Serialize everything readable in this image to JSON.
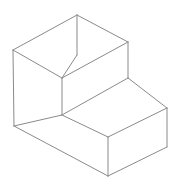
{
  "figure": {
    "type": "line-drawing",
    "background_color": "#ffffff",
    "line_color": "#8a8a8a",
    "line_width": 1,
    "canvas": {
      "width": 180,
      "height": 191
    },
    "vertices": {
      "top_apex": [
        77,
        15
      ],
      "top_left": [
        13,
        50
      ],
      "top_right": [
        128,
        42
      ],
      "top_inner": [
        62,
        78
      ],
      "mid_left_bottom": [
        14,
        126
      ],
      "mid_right": [
        128,
        78
      ],
      "step_front": [
        62,
        115
      ],
      "step_right_top": [
        167,
        108
      ],
      "step_far_right_top": [
        167,
        147
      ],
      "bottom_apex": [
        108,
        176
      ],
      "bottom_left_join": [
        62,
        152
      ],
      "bottom_mid": [
        108,
        137
      ]
    },
    "edges": [
      {
        "name": "top-face-left-back",
        "from": [
          13,
          50
        ],
        "to": [
          77,
          15
        ]
      },
      {
        "name": "top-face-right-back",
        "from": [
          77,
          15
        ],
        "to": [
          128,
          42
        ]
      },
      {
        "name": "top-face-right-front",
        "from": [
          128,
          42
        ],
        "to": [
          62,
          78
        ]
      },
      {
        "name": "top-face-left-front",
        "from": [
          62,
          78
        ],
        "to": [
          13,
          50
        ]
      },
      {
        "name": "vertical-center-spine",
        "from": [
          77,
          15
        ],
        "to": [
          77,
          55
        ]
      },
      {
        "name": "inner-edge-to-spine",
        "from": [
          77,
          55
        ],
        "to": [
          62,
          78
        ]
      },
      {
        "name": "left-vertical",
        "from": [
          13,
          50
        ],
        "to": [
          14,
          126
        ]
      },
      {
        "name": "right-vertical-upper",
        "from": [
          128,
          42
        ],
        "to": [
          128,
          78
        ]
      },
      {
        "name": "step-vertical",
        "from": [
          62,
          78
        ],
        "to": [
          62,
          115
        ]
      },
      {
        "name": "step-top-right",
        "from": [
          128,
          78
        ],
        "to": [
          167,
          108
        ]
      },
      {
        "name": "step-top-front",
        "from": [
          62,
          115
        ],
        "to": [
          108,
          137
        ]
      },
      {
        "name": "step-top-right-front",
        "from": [
          108,
          137
        ],
        "to": [
          167,
          108
        ]
      },
      {
        "name": "right-vertical-lower",
        "from": [
          167,
          108
        ],
        "to": [
          167,
          147
        ]
      },
      {
        "name": "front-bottom-right",
        "from": [
          167,
          147
        ],
        "to": [
          108,
          176
        ]
      },
      {
        "name": "front-bottom-left",
        "from": [
          108,
          176
        ],
        "to": [
          14,
          126
        ]
      },
      {
        "name": "front-vertical-center",
        "from": [
          108,
          137
        ],
        "to": [
          108,
          176
        ]
      },
      {
        "name": "left-face-bottom-diag",
        "from": [
          14,
          126
        ],
        "to": [
          62,
          115
        ]
      }
    ]
  }
}
